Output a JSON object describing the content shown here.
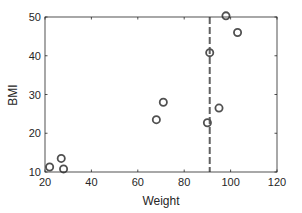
{
  "chart_data": {
    "type": "scatter",
    "title": "",
    "xlabel": "Weight",
    "ylabel": "BMI",
    "xlim": [
      20,
      120
    ],
    "ylim": [
      10,
      50
    ],
    "xticks": [
      20,
      40,
      60,
      80,
      100,
      120
    ],
    "yticks": [
      10,
      20,
      30,
      40,
      50
    ],
    "grid": false,
    "legend": null,
    "marker": "open-circle",
    "series": [
      {
        "name": "points",
        "points": [
          {
            "x": 22,
            "y": 11.3
          },
          {
            "x": 27,
            "y": 13.5
          },
          {
            "x": 28,
            "y": 10.8
          },
          {
            "x": 68,
            "y": 23.5
          },
          {
            "x": 71,
            "y": 28
          },
          {
            "x": 90,
            "y": 22.7
          },
          {
            "x": 91,
            "y": 40.8
          },
          {
            "x": 95,
            "y": 26.5
          },
          {
            "x": 98,
            "y": 50.3
          },
          {
            "x": 103,
            "y": 46
          }
        ]
      }
    ],
    "annotations": [
      {
        "type": "vline",
        "x": 91,
        "style": "dashed"
      }
    ]
  },
  "colors": {
    "marker": "#505050",
    "axis": "#262626",
    "vline": "#606060"
  }
}
